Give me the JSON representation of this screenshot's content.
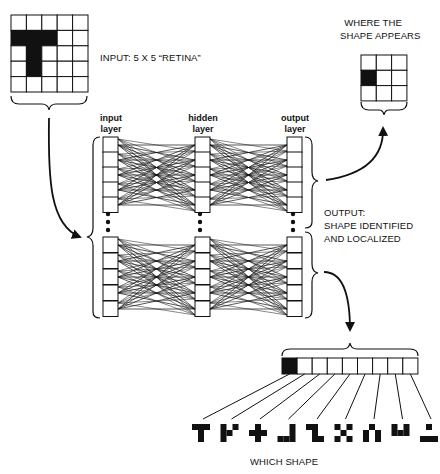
{
  "input": {
    "label": "INPUT:  5 X 5 “RETINA”",
    "grid_size": 5,
    "filled": [
      [
        1,
        0
      ],
      [
        1,
        1
      ],
      [
        1,
        2
      ],
      [
        2,
        1
      ],
      [
        3,
        1
      ]
    ]
  },
  "location": {
    "label_line1": "WHERE THE",
    "label_line2": "SHAPE APPEARS",
    "grid_size": 3,
    "filled": [
      [
        1,
        0
      ]
    ]
  },
  "network": {
    "layers": [
      {
        "line1": "input",
        "line2": "layer"
      },
      {
        "line1": "hidden",
        "line2": "layer"
      },
      {
        "line1": "output",
        "line2": "layer"
      }
    ]
  },
  "output": {
    "label_line1": "OUTPUT:",
    "label_line2": "SHAPE IDENTIFIED",
    "label_line3": "AND LOCALIZED"
  },
  "shape_vector": {
    "cells": 9,
    "filled_index": 0,
    "shapes": [
      "T",
      "T-rotated",
      "plus",
      "J",
      "Z",
      "X",
      "arch",
      "U",
      "bars"
    ],
    "label": "WHICH SHAPE"
  },
  "colors": {
    "ink": "#111111",
    "background": "#ffffff"
  }
}
